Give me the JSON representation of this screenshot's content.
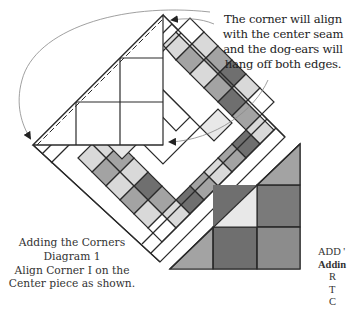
{
  "diagram": {
    "title": "Adding the Corners",
    "subtitle": "Diagram 1",
    "caption_lines": [
      "Adding the Corners",
      "Diagram 1",
      "Align Corner I on the",
      "Center piece as shown."
    ],
    "callout_lines": [
      "The corner will align",
      "with the center seam",
      "and the dog-ears will",
      "hang off both edges."
    ],
    "side_text_lines": [
      "ADD '",
      "Addin",
      "R",
      "T",
      "C"
    ],
    "colors": {
      "line": "#2a2a2a",
      "white": "#ffffff",
      "light_gray": "#d9d9d9",
      "mid_gray": "#a3a3a3",
      "dark_gray": "#6f6f6f",
      "arrow": "#888888"
    }
  }
}
